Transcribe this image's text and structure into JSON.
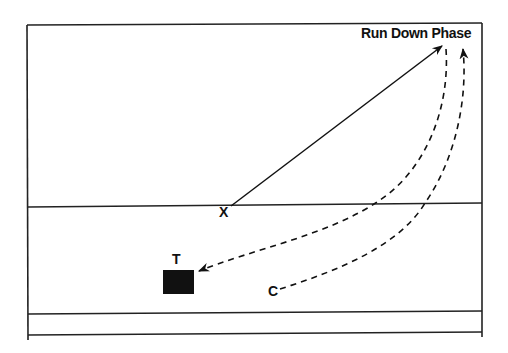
{
  "diagram": {
    "title": "Run Down Phase",
    "labels": {
      "x_player": "X",
      "c_player": "C",
      "target": "T"
    },
    "colors": {
      "ink": "#111111",
      "background": "#ffffff"
    },
    "elements": [
      {
        "id": "field-frame",
        "type": "frame"
      },
      {
        "id": "line-upper",
        "type": "horizontal-line"
      },
      {
        "id": "line-lower-1",
        "type": "horizontal-line"
      },
      {
        "id": "line-lower-2",
        "type": "horizontal-line"
      },
      {
        "id": "path-x",
        "type": "solid-arrow",
        "from": "X",
        "to": "top-right"
      },
      {
        "id": "path-return",
        "type": "dashed-arrow",
        "from": "top-right",
        "to": "T"
      },
      {
        "id": "path-c",
        "type": "dashed-arrow",
        "from": "C",
        "to": "top-right"
      }
    ]
  }
}
